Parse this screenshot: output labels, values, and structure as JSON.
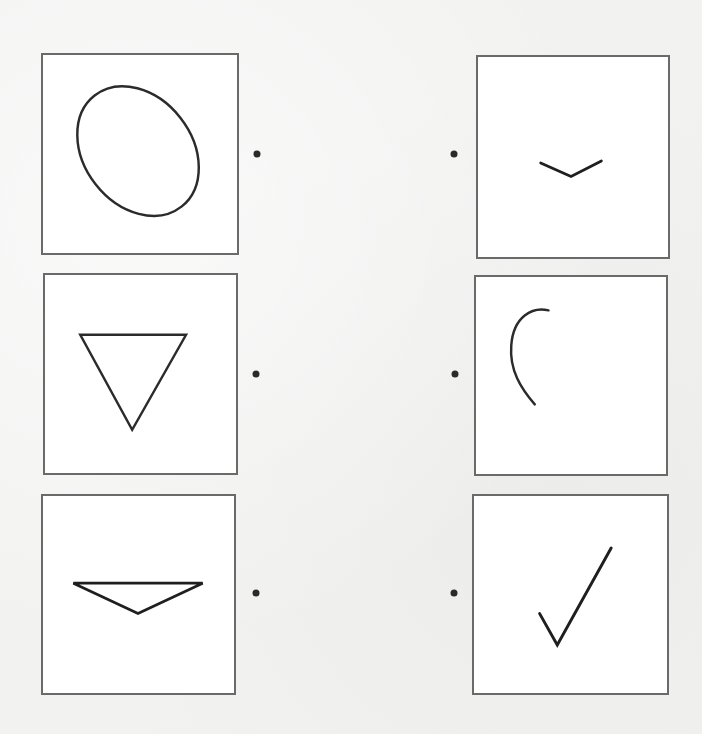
{
  "worksheet": {
    "left_column": [
      {
        "shape": "ellipse",
        "label": "tilted oval"
      },
      {
        "shape": "inverted-triangle",
        "label": "downward triangle"
      },
      {
        "shape": "flat-triangle",
        "label": "wide flat triangle"
      }
    ],
    "right_column": [
      {
        "shape": "chevron",
        "label": "small V angle"
      },
      {
        "shape": "arc",
        "label": "curved arc"
      },
      {
        "shape": "checkmark",
        "label": "check mark"
      }
    ],
    "colors": {
      "stroke": "#2b2b2b",
      "frame": "#6a6a6a",
      "dot": "#2a2a2a",
      "paper": "#f2f2f1"
    }
  }
}
